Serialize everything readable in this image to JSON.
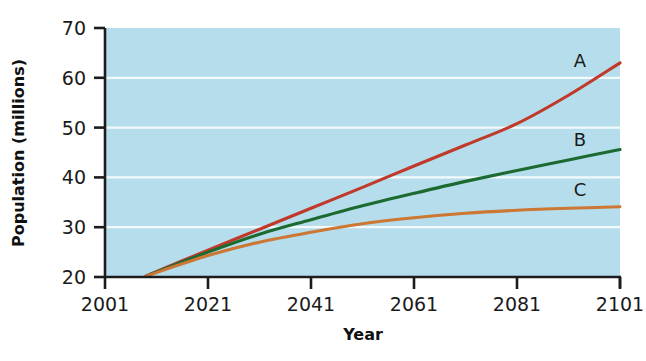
{
  "chart_data": {
    "type": "line",
    "title": "",
    "xlabel": "Year",
    "ylabel": "Population (millions)",
    "xlim": [
      2001,
      2101
    ],
    "ylim": [
      20,
      70
    ],
    "xticks": [
      2001,
      2021,
      2041,
      2061,
      2081,
      2101
    ],
    "yticks": [
      20,
      30,
      40,
      50,
      60,
      70
    ],
    "grid": true,
    "grid_color": "#ffffff",
    "plot_background": "#b6ddeb",
    "legend_position": "inline-right-of-curves",
    "series": [
      {
        "name": "A",
        "label": "A",
        "color": "#c0392b",
        "x": [
          2009,
          2021,
          2031,
          2041,
          2051,
          2061,
          2071,
          2081,
          2091,
          2101
        ],
        "values": [
          20.2,
          25.4,
          29.6,
          33.8,
          38.0,
          42.3,
          46.5,
          50.8,
          56.5,
          63.0
        ]
      },
      {
        "name": "B",
        "label": "B",
        "color": "#1b6b31",
        "x": [
          2009,
          2021,
          2031,
          2041,
          2051,
          2061,
          2071,
          2081,
          2091,
          2101
        ],
        "values": [
          20.2,
          25.0,
          28.6,
          31.5,
          34.3,
          36.8,
          39.2,
          41.4,
          43.5,
          45.6
        ]
      },
      {
        "name": "C",
        "label": "C",
        "color": "#cc7733",
        "x": [
          2009,
          2021,
          2031,
          2041,
          2051,
          2061,
          2071,
          2081,
          2091,
          2101
        ],
        "values": [
          20.2,
          24.3,
          27.0,
          29.0,
          30.7,
          31.9,
          32.8,
          33.4,
          33.8,
          34.1
        ]
      }
    ]
  },
  "axis": {
    "y_title": "Population (millions)",
    "x_title": "Year",
    "y_tick_labels": [
      "70",
      "60",
      "50",
      "40",
      "30",
      "20"
    ],
    "x_tick_labels": [
      "2001",
      "2021",
      "2041",
      "2061",
      "2081",
      "2101"
    ]
  },
  "series_labels": {
    "a": "A",
    "b": "B",
    "c": "C"
  },
  "colors": {
    "series_a": "#c0392b",
    "series_b": "#1b6b31",
    "series_c": "#cc7733",
    "plot_bg": "#b6ddeb",
    "gridline": "#ffffff",
    "axis": "#1c1c1c"
  }
}
